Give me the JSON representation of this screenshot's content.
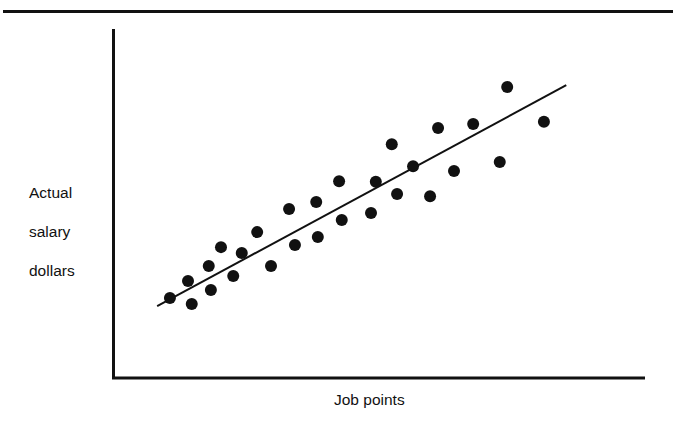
{
  "chart_data": {
    "type": "scatter",
    "title": "",
    "xlabel": "Job points",
    "ylabel": "Actual salary dollars",
    "ylabel_lines": [
      "Actual",
      "salary",
      "dollars"
    ],
    "x_ticks": [],
    "y_ticks": [],
    "xlim": [
      0,
      100
    ],
    "ylim": [
      0,
      100
    ],
    "units_note": "Axes are unlabeled; values are relative positions on a 0-100 scale",
    "grid": false,
    "legend": null,
    "series": [
      {
        "name": "Jobs",
        "marker": "filled-circle",
        "points": [
          {
            "x": 10.7,
            "y": 22.9
          },
          {
            "x": 14.1,
            "y": 27.8
          },
          {
            "x": 14.8,
            "y": 21.2
          },
          {
            "x": 18.0,
            "y": 32.1
          },
          {
            "x": 18.4,
            "y": 25.2
          },
          {
            "x": 20.3,
            "y": 37.5
          },
          {
            "x": 22.6,
            "y": 29.2
          },
          {
            "x": 24.2,
            "y": 35.8
          },
          {
            "x": 27.1,
            "y": 41.8
          },
          {
            "x": 29.7,
            "y": 32.1
          },
          {
            "x": 33.1,
            "y": 48.4
          },
          {
            "x": 34.2,
            "y": 38.1
          },
          {
            "x": 38.2,
            "y": 50.4
          },
          {
            "x": 38.5,
            "y": 40.4
          },
          {
            "x": 42.5,
            "y": 56.4
          },
          {
            "x": 43.0,
            "y": 45.3
          },
          {
            "x": 48.5,
            "y": 47.3
          },
          {
            "x": 49.4,
            "y": 56.2
          },
          {
            "x": 52.4,
            "y": 67.0
          },
          {
            "x": 53.4,
            "y": 52.7
          },
          {
            "x": 56.4,
            "y": 60.7
          },
          {
            "x": 59.6,
            "y": 52.1
          },
          {
            "x": 61.1,
            "y": 71.6
          },
          {
            "x": 64.1,
            "y": 59.3
          },
          {
            "x": 67.7,
            "y": 72.8
          },
          {
            "x": 72.7,
            "y": 61.9
          },
          {
            "x": 74.1,
            "y": 83.4
          },
          {
            "x": 81.0,
            "y": 73.4
          }
        ]
      }
    ],
    "trend_line": {
      "name": "Salary line (best fit)",
      "start": {
        "x": 8.3,
        "y": 20.6
      },
      "end": {
        "x": 85.2,
        "y": 83.9
      }
    },
    "colors": {
      "ink": "#111111",
      "background": "#ffffff"
    }
  },
  "labels": {
    "y_axis": [
      "Actual",
      "salary",
      "dollars"
    ],
    "x_axis": "Job points"
  }
}
